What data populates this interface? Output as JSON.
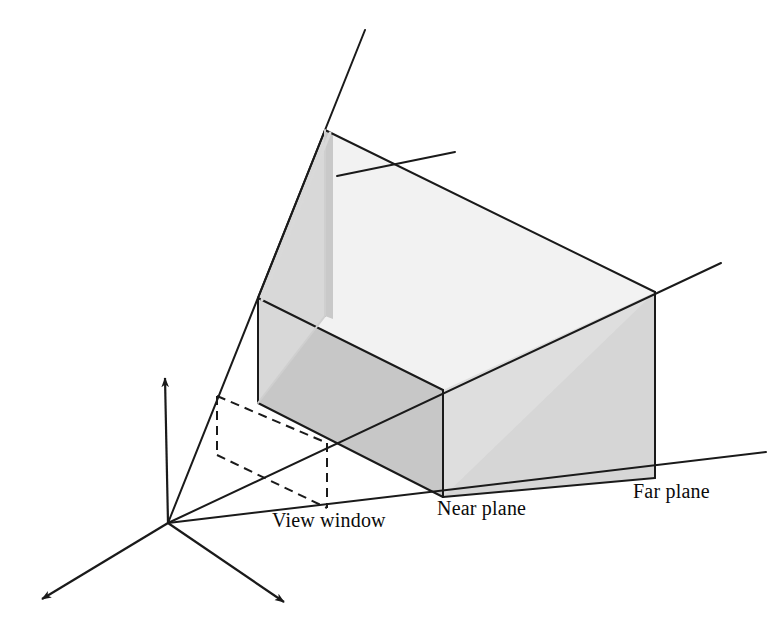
{
  "figure": {
    "background_color": "#ffffff",
    "stroke_color": "#1a1a1a",
    "labels": [
      {
        "id": "view-window",
        "text": "View window",
        "x": 272,
        "y": 509
      },
      {
        "id": "near-plane",
        "text": "Near plane",
        "x": 437,
        "y": 497
      },
      {
        "id": "far-plane",
        "text": "Far plane",
        "x": 633,
        "y": 480
      }
    ],
    "colors": {
      "top_face": "#f1f1f1",
      "far_face": "#dcdcdc",
      "right_face": "#e0e0e0",
      "near_left_face": "#c6c6c6",
      "bottom_face": "#d2d2d2",
      "outline": "#1a1a1a",
      "text": "#0b0b0b"
    },
    "geometry": {
      "origin": {
        "x": 168,
        "y": 523
      },
      "axes": [
        {
          "id": "y-axis-up",
          "from": [
            168,
            523
          ],
          "to": [
            165,
            374
          ],
          "arrow": true
        },
        {
          "id": "x-axis-down-left",
          "from": [
            168,
            523
          ],
          "to": [
            37,
            602
          ],
          "arrow": true
        },
        {
          "id": "z-axis-down-right",
          "from": [
            168,
            523
          ],
          "to": [
            289,
            606
          ],
          "arrow": true
        }
      ],
      "frustum_rays": [
        {
          "id": "ray-top-left",
          "from": [
            168,
            523
          ],
          "to": [
            365,
            30
          ]
        },
        {
          "id": "ray-top-right",
          "from": [
            168,
            523
          ],
          "to": [
            455,
            152
          ]
        },
        {
          "id": "ray-bottom-right",
          "from": [
            168,
            523
          ],
          "to": [
            721,
            263
          ]
        },
        {
          "id": "ray-bottom-front",
          "from": [
            168,
            523
          ],
          "to": [
            766,
            452
          ]
        }
      ],
      "near_plane": {
        "top_left": [
          258,
          298
        ],
        "top_right": [
          443,
          390
        ],
        "bottom_right": [
          443,
          497
        ],
        "bottom_left": [
          258,
          403
        ]
      },
      "far_plane": {
        "top_left": [
          325,
          130
        ],
        "top_right": [
          655,
          292
        ],
        "bottom_right": [
          655,
          478
        ],
        "bottom_left": [
          325,
          316
        ]
      },
      "view_window": {
        "top_left": [
          217,
          396
        ],
        "top_right": [
          327,
          443
        ],
        "bottom_right": [
          327,
          508
        ],
        "bottom_left": [
          217,
          455
        ],
        "dashed": true
      }
    }
  }
}
